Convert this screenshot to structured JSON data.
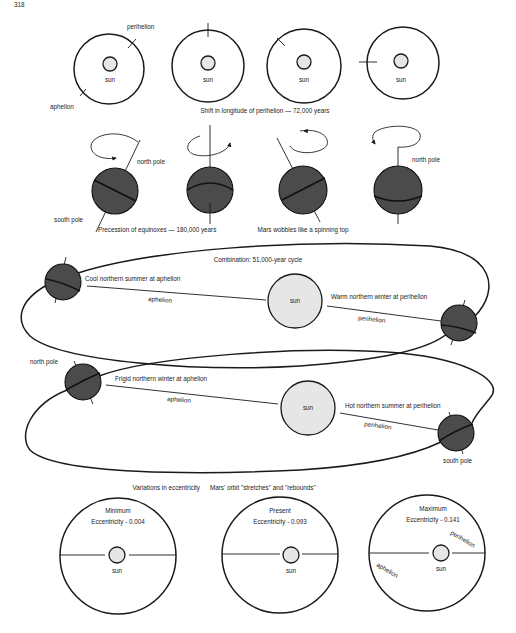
{
  "page": {
    "number": "318"
  },
  "panel_perihelion": {
    "caption": "Shift in longitude of perihelion — 72,000 years",
    "labels": {
      "perihelion": "perihelion",
      "aphelion": "aphelion"
    },
    "orbits": [
      {
        "sun_label": "sun",
        "marker_angle_deg": -45
      },
      {
        "sun_label": "sun",
        "marker_angle_deg": -90
      },
      {
        "sun_label": "sun",
        "marker_angle_deg": -135
      },
      {
        "sun_label": "sun",
        "marker_angle_deg": 180
      }
    ]
  },
  "panel_precession": {
    "caption_left": "Precession of equinoxes — 180,000 years",
    "caption_right": "Mars wobbles like a spinning top",
    "labels": {
      "north_pole": "north pole",
      "south_pole": "south pole"
    }
  },
  "panel_combination": {
    "title": "Combination: 51,000-year cycle",
    "top": {
      "left_note": "Cool northern summer at aphelion",
      "right_note": "Warm northern winter at perihelion",
      "aphelion": "aphelion",
      "perihelion": "perihelion",
      "sun_label": "sun"
    },
    "bottom": {
      "left_note": "Frigid northern winter at aphelion",
      "right_note": "Hot northern summer at perihelion",
      "aphelion": "aphelion",
      "perihelion": "perihelion",
      "sun_label": "sun",
      "north_pole": "north pole",
      "south_pole": "south pole"
    }
  },
  "panel_eccentricity": {
    "caption_left": "Variations in eccentricity",
    "caption_right": "Mars' orbit \"stretches\" and \"rebounds\"",
    "orbits": [
      {
        "title": "Minimum",
        "value": "Eccentricity - 0.004",
        "sun_label": "sun"
      },
      {
        "title": "Present",
        "value": "Eccentricity - 0.093",
        "sun_label": "sun"
      },
      {
        "title": "Maximum",
        "value": "Eccentricity - 0.141",
        "sun_label": "sun",
        "perihelion": "perihelion",
        "aphelion": "aphelion"
      }
    ]
  },
  "colors": {
    "background": "#ffffff",
    "line": "#1a1a1a",
    "sun_fill": "#e6e6e6",
    "planet_fill": "#4b4b4b"
  }
}
